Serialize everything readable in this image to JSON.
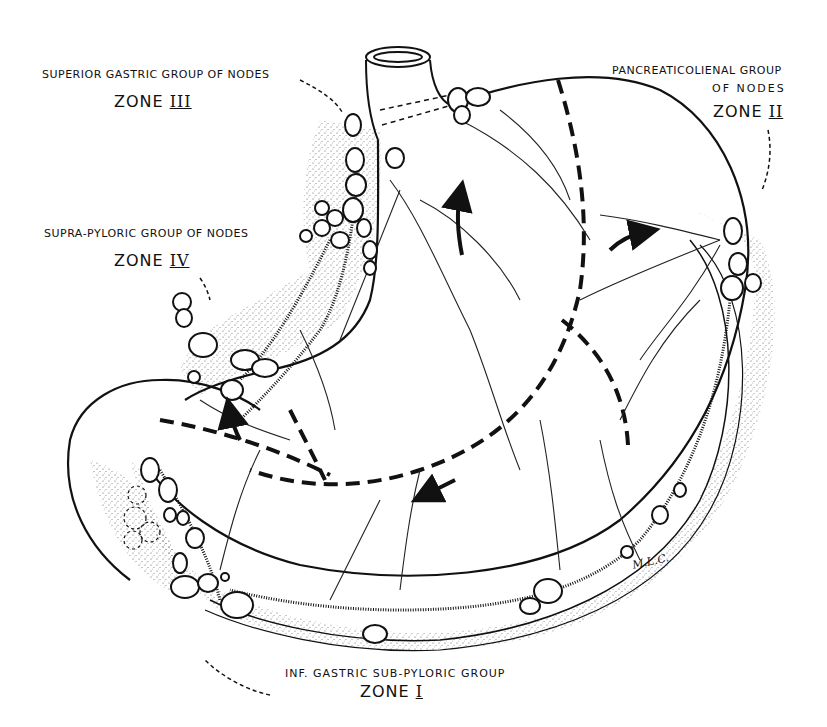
{
  "diagram": {
    "labels": {
      "zone3": {
        "group": "SUPERIOR GASTRIC  GROUP OF NODES",
        "zone_word": "ZONE",
        "numeral": "III"
      },
      "zone2": {
        "group_line1": "PANCREATICOLIENAL GROUP",
        "group_line2": "OF NODES",
        "zone_word": "ZONE",
        "numeral": "II"
      },
      "zone4": {
        "group": "SUPRA-PYLORIC  GROUP OF NODES",
        "zone_word": "ZONE",
        "numeral": "IV"
      },
      "zone1": {
        "group": "INF. GASTRIC  SUB-PYLORIC  GROUP",
        "zone_word": "ZONE",
        "numeral": "I"
      }
    },
    "signature": "M.L.C.",
    "colors": {
      "ink": "#111111",
      "background": "#ffffff",
      "stipple": "#555555"
    }
  }
}
